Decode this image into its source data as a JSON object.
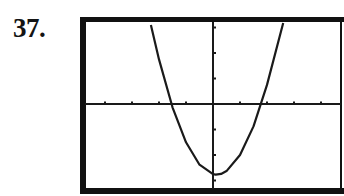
{
  "problem_number": "37.",
  "chart_data": {
    "type": "line",
    "title": "",
    "xlabel": "",
    "ylabel": "",
    "xlim": [
      -4,
      4.7
    ],
    "ylim": [
      -3.5,
      3.4
    ],
    "x_ticks": [
      -4,
      -3,
      -2,
      -1,
      1,
      2,
      3,
      4
    ],
    "y_ticks": [
      -3,
      -2,
      -1,
      1,
      2,
      3
    ],
    "grid": false,
    "legend": null,
    "series": [
      {
        "name": "parabola",
        "x": [
          -2.3,
          -2.0,
          -1.5,
          -1.0,
          -0.5,
          0.0,
          0.1,
          0.3,
          0.5,
          1.0,
          1.5,
          2.0,
          2.6
        ],
        "y": [
          3.1,
          1.75,
          -0.13,
          -1.5,
          -2.38,
          -2.75,
          -2.77,
          -2.74,
          -2.63,
          -2.0,
          -0.88,
          0.75,
          3.36
        ]
      }
    ],
    "key_points": {
      "vertex": [
        0.1,
        -2.8
      ],
      "x_intercepts": [
        -1.55,
        1.8
      ],
      "y_intercept": -2.75
    },
    "colors": {
      "curve": "#1a1a1a",
      "axes": "#1a1a1a",
      "frame": "#111111",
      "background": "#ffffff"
    }
  }
}
